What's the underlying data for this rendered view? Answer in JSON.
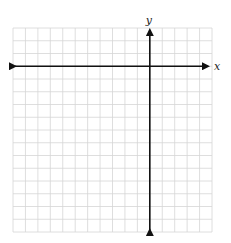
{
  "diagram": {
    "type": "coordinate-grid",
    "grid": {
      "left": 13,
      "top": 28,
      "right": 212,
      "bottom": 232,
      "columns": 16,
      "rows": 16,
      "line_color": "#d6d6d6"
    },
    "axes": {
      "color": "#111111",
      "x_axis_label": "x",
      "y_axis_label": "y",
      "y_axis_column": 11,
      "x_axis_row": 3
    }
  }
}
